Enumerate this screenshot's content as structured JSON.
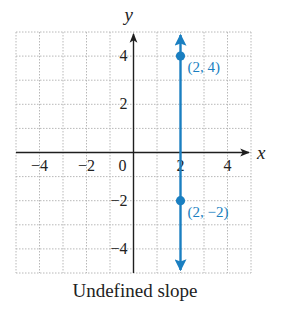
{
  "chart_data": {
    "type": "line",
    "title": "",
    "caption": "Undefined slope",
    "xlabel": "x",
    "ylabel": "y",
    "xlim": [
      -5,
      5
    ],
    "ylim": [
      -5,
      5
    ],
    "grid": true,
    "x_ticks": [
      -4,
      -2,
      0,
      2,
      4
    ],
    "x_tick_labels": [
      "−4",
      "−2",
      "0",
      "2",
      "4"
    ],
    "y_ticks": [
      4,
      2,
      -2,
      -4
    ],
    "y_tick_labels": [
      "4",
      "2",
      "−2",
      "−4"
    ],
    "series": [
      {
        "name": "x = 2",
        "kind": "vertical-line",
        "x": 2,
        "arrows": "both",
        "color": "#1a7fc1",
        "points": [
          {
            "x": 2,
            "y": 4,
            "label": "(2, 4)"
          },
          {
            "x": 2,
            "y": -2,
            "label": "(2, −2)"
          }
        ]
      }
    ]
  },
  "colors": {
    "line": "#1a7fc1",
    "axis": "#1e1e1e",
    "grid": "#b8b8b8",
    "text": "#222222"
  }
}
